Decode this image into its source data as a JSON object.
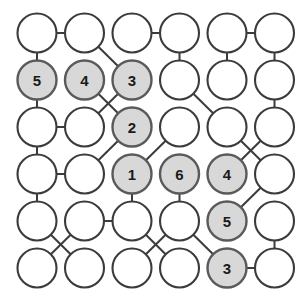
{
  "diagram": {
    "type": "node-link-grid",
    "rows": 6,
    "cols": 6,
    "geometry": {
      "origin_x": 37,
      "origin_y": 33,
      "col_step": 47.5,
      "row_step": 47.0,
      "radius": 19.5
    },
    "colors": {
      "node_fill": "#ffffff",
      "node_fill_shaded": "#d8d8d8",
      "node_stroke": "#3b3b3b",
      "node_stroke_shaded": "#5a5a5a",
      "edge": "#3b3b3b",
      "label": "#1a1a1a",
      "background": "#ffffff"
    },
    "nodes": [
      {
        "id": "r1c1",
        "row": 1,
        "col": 1,
        "label": "",
        "shaded": false
      },
      {
        "id": "r1c2",
        "row": 1,
        "col": 2,
        "label": "",
        "shaded": false
      },
      {
        "id": "r1c3",
        "row": 1,
        "col": 3,
        "label": "",
        "shaded": false
      },
      {
        "id": "r1c4",
        "row": 1,
        "col": 4,
        "label": "",
        "shaded": false
      },
      {
        "id": "r1c5",
        "row": 1,
        "col": 5,
        "label": "",
        "shaded": false
      },
      {
        "id": "r1c6",
        "row": 1,
        "col": 6,
        "label": "",
        "shaded": false
      },
      {
        "id": "r2c1",
        "row": 2,
        "col": 1,
        "label": "5",
        "shaded": true
      },
      {
        "id": "r2c2",
        "row": 2,
        "col": 2,
        "label": "4",
        "shaded": true
      },
      {
        "id": "r2c3",
        "row": 2,
        "col": 3,
        "label": "3",
        "shaded": true
      },
      {
        "id": "r2c4",
        "row": 2,
        "col": 4,
        "label": "",
        "shaded": false
      },
      {
        "id": "r2c5",
        "row": 2,
        "col": 5,
        "label": "",
        "shaded": false
      },
      {
        "id": "r2c6",
        "row": 2,
        "col": 6,
        "label": "",
        "shaded": false
      },
      {
        "id": "r3c1",
        "row": 3,
        "col": 1,
        "label": "",
        "shaded": false
      },
      {
        "id": "r3c2",
        "row": 3,
        "col": 2,
        "label": "",
        "shaded": false
      },
      {
        "id": "r3c3",
        "row": 3,
        "col": 3,
        "label": "2",
        "shaded": true
      },
      {
        "id": "r3c4",
        "row": 3,
        "col": 4,
        "label": "",
        "shaded": false
      },
      {
        "id": "r3c5",
        "row": 3,
        "col": 5,
        "label": "",
        "shaded": false
      },
      {
        "id": "r3c6",
        "row": 3,
        "col": 6,
        "label": "",
        "shaded": false
      },
      {
        "id": "r4c1",
        "row": 4,
        "col": 1,
        "label": "",
        "shaded": false
      },
      {
        "id": "r4c2",
        "row": 4,
        "col": 2,
        "label": "",
        "shaded": false
      },
      {
        "id": "r4c3",
        "row": 4,
        "col": 3,
        "label": "1",
        "shaded": true
      },
      {
        "id": "r4c4",
        "row": 4,
        "col": 4,
        "label": "6",
        "shaded": true
      },
      {
        "id": "r4c5",
        "row": 4,
        "col": 5,
        "label": "4",
        "shaded": true
      },
      {
        "id": "r4c6",
        "row": 4,
        "col": 6,
        "label": "",
        "shaded": false
      },
      {
        "id": "r5c1",
        "row": 5,
        "col": 1,
        "label": "",
        "shaded": false
      },
      {
        "id": "r5c2",
        "row": 5,
        "col": 2,
        "label": "",
        "shaded": false
      },
      {
        "id": "r5c3",
        "row": 5,
        "col": 3,
        "label": "",
        "shaded": false
      },
      {
        "id": "r5c4",
        "row": 5,
        "col": 4,
        "label": "",
        "shaded": false
      },
      {
        "id": "r5c5",
        "row": 5,
        "col": 5,
        "label": "5",
        "shaded": true
      },
      {
        "id": "r5c6",
        "row": 5,
        "col": 6,
        "label": "",
        "shaded": false
      },
      {
        "id": "r6c1",
        "row": 6,
        "col": 1,
        "label": "",
        "shaded": false
      },
      {
        "id": "r6c2",
        "row": 6,
        "col": 2,
        "label": "",
        "shaded": false
      },
      {
        "id": "r6c3",
        "row": 6,
        "col": 3,
        "label": "",
        "shaded": false
      },
      {
        "id": "r6c4",
        "row": 6,
        "col": 4,
        "label": "",
        "shaded": false
      },
      {
        "id": "r6c5",
        "row": 6,
        "col": 5,
        "label": "3",
        "shaded": true
      },
      {
        "id": "r6c6",
        "row": 6,
        "col": 6,
        "label": "",
        "shaded": false
      }
    ],
    "edges": [
      {
        "from": "r1c1",
        "to": "r1c2"
      },
      {
        "from": "r1c3",
        "to": "r1c4"
      },
      {
        "from": "r1c5",
        "to": "r1c6"
      },
      {
        "from": "r1c1",
        "to": "r2c1"
      },
      {
        "from": "r1c2",
        "to": "r2c3"
      },
      {
        "from": "r1c4",
        "to": "r2c4"
      },
      {
        "from": "r1c5",
        "to": "r2c5"
      },
      {
        "from": "r1c6",
        "to": "r2c6"
      },
      {
        "from": "r2c1",
        "to": "r3c1"
      },
      {
        "from": "r2c2",
        "to": "r3c3"
      },
      {
        "from": "r2c3",
        "to": "r3c2"
      },
      {
        "from": "r2c4",
        "to": "r3c5"
      },
      {
        "from": "r2c6",
        "to": "r3c6"
      },
      {
        "from": "r3c1",
        "to": "r3c2"
      },
      {
        "from": "r3c1",
        "to": "r4c1"
      },
      {
        "from": "r3c3",
        "to": "r4c2"
      },
      {
        "from": "r3c4",
        "to": "r4c3"
      },
      {
        "from": "r3c5",
        "to": "r4c6"
      },
      {
        "from": "r3c6",
        "to": "r4c5"
      },
      {
        "from": "r4c1",
        "to": "r4c2"
      },
      {
        "from": "r4c1",
        "to": "r5c1"
      },
      {
        "from": "r4c3",
        "to": "r5c3"
      },
      {
        "from": "r4c4",
        "to": "r5c4"
      },
      {
        "from": "r4c6",
        "to": "r5c5"
      },
      {
        "from": "r5c2",
        "to": "r5c3"
      },
      {
        "from": "r5c1",
        "to": "r6c2"
      },
      {
        "from": "r5c2",
        "to": "r6c1"
      },
      {
        "from": "r5c3",
        "to": "r6c4"
      },
      {
        "from": "r5c4",
        "to": "r6c3"
      },
      {
        "from": "r5c4",
        "to": "r6c5"
      },
      {
        "from": "r5c6",
        "to": "r6c6"
      },
      {
        "from": "r6c5",
        "to": "r6c6"
      }
    ]
  }
}
